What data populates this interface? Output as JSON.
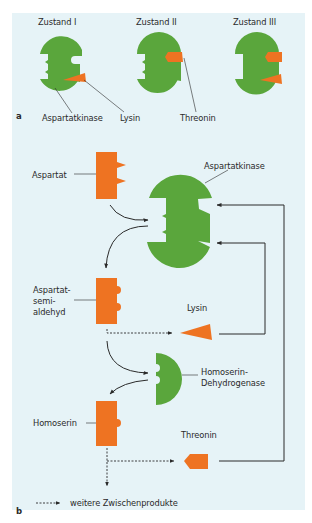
{
  "figure": {
    "colors": {
      "enzyme_green": "#5aa63c",
      "substrate_orange": "#ee7322",
      "panel_background": "#e6f3f7",
      "line": "#2a2a2a"
    },
    "panel_a": {
      "letter": "a",
      "states": [
        {
          "label": "Zustand I",
          "bound": [
            "Lysin"
          ]
        },
        {
          "label": "Zustand II",
          "bound": [
            "Threonin"
          ]
        },
        {
          "label": "Zustand III",
          "bound": [
            "Threonin",
            "Lysin"
          ]
        }
      ],
      "annotations": {
        "enzyme": "Aspartatkinase",
        "lysin": "Lysin",
        "threonin": "Threonin"
      }
    },
    "panel_b": {
      "letter": "b",
      "nodes": {
        "aspartat": "Aspartat",
        "aspartatkinase": "Aspartatkinase",
        "aspartatsemialdehyd_l1": "Aspartat-",
        "aspartatsemialdehyd_l2": "semi-",
        "aspartatsemialdehyd_l3": "aldehyd",
        "lysin": "Lysin",
        "homoserin_dh_l1": "Homoserin-",
        "homoserin_dh_l2": "Dehydrogenase",
        "homoserin": "Homoserin",
        "threonin": "Threonin"
      },
      "legend": {
        "dashed_arrow": "weitere Zwischenprodukte"
      }
    }
  }
}
